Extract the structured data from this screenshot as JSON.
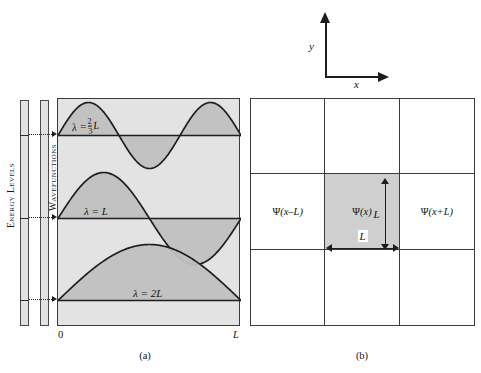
{
  "figure": {
    "panel_a": {
      "caption": "(a)",
      "axis_left_label": "0",
      "axis_right_label": "L",
      "side_bars": [
        {
          "name": "energy-levels",
          "label": "Energy Levels"
        },
        {
          "name": "wavefunctions",
          "label": "Wavefunctions"
        }
      ],
      "waves": [
        {
          "id": "n3",
          "lambda_text": "λ =",
          "lambda_frac_num": "2",
          "lambda_frac_den": "3",
          "lambda_tail": "L",
          "periods": 1.5,
          "baseline_y": 135
        },
        {
          "id": "n2",
          "lambda_text": "λ = L",
          "lambda_frac_num": "",
          "lambda_frac_den": "",
          "lambda_tail": "",
          "periods": 1.0,
          "baseline_y": 218
        },
        {
          "id": "n1",
          "lambda_text": "λ = 2L",
          "lambda_frac_num": "",
          "lambda_frac_den": "",
          "lambda_tail": "",
          "periods": 0.5,
          "baseline_y": 300
        }
      ]
    },
    "panel_b": {
      "caption": "(b)",
      "cells": [
        {
          "label": ""
        },
        {
          "label": ""
        },
        {
          "label": ""
        },
        {
          "label_psi": "ψ",
          "label_arg": "(x–L)",
          "shaded": false
        },
        {
          "label_psi": "ψ",
          "label_arg": "(x)",
          "shaded": true
        },
        {
          "label_psi": "ψ",
          "label_arg": "(x+L)",
          "shaded": false
        },
        {
          "label": ""
        },
        {
          "label": ""
        },
        {
          "label": ""
        }
      ],
      "dim_vertical_label": "L",
      "dim_horizontal_label": "L",
      "axes": {
        "x_label": "x",
        "y_label": "y"
      }
    },
    "colors": {
      "panel_a_fill": "#e3e3e3",
      "wave_fill": "#c4c4c4",
      "shaded_cell": "#cfcfcf",
      "stroke": "#3b3b3b",
      "bar_fill": "#e2e2e2"
    }
  }
}
